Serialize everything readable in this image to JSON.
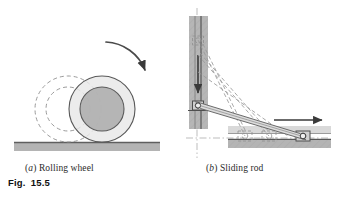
{
  "figure": {
    "label_prefix": "Fig.",
    "label_number": "15.5",
    "panels": [
      {
        "id": "a",
        "tag": "(a)",
        "tag_letter": "a",
        "caption": "Rolling wheel",
        "description": "Rolling wheel shown in two positions: dashed earlier position at left and solid current position at right, resting on a horizontal ground surface, with a curved arrow indicating clockwise rotation.",
        "elements": [
          "ground-bar",
          "wheel-ghost-outline",
          "wheel-solid",
          "wheel-hub",
          "rotation-arrow"
        ]
      },
      {
        "id": "b",
        "tag": "(b)",
        "tag_letter": "b",
        "caption": "Sliding rod",
        "description": "Rod with one end sliding down a vertical guide and the other end sliding right along a horizontal guide; dashed lines show earlier and later rod positions. Arrows show the direction of motion of each slider.",
        "elements": [
          "vertical-guide",
          "vertical-slider",
          "down-arrow",
          "rod-solid",
          "rod-ghost-1",
          "rod-ghost-2",
          "rod-ghost-3",
          "horizontal-guide",
          "horizontal-slider",
          "right-arrow",
          "centerline-vertical",
          "centerline-horizontal"
        ]
      }
    ]
  },
  "colors": {
    "ink": "#2b2b2b",
    "label_ink": "#111111",
    "ground_fill": "#b4b4b4",
    "ground_edge": "#6e6e6e",
    "wheel_rim_fill": "#e6e6e6",
    "wheel_hub_fill": "#b0b0b0",
    "wheel_stroke": "#555555",
    "ghost_stroke": "#8c8c8c",
    "guide_fill": "#b6b6b6",
    "guide_edge": "#6e6e6e",
    "rod_fill": "#d8d8d8",
    "rod_stroke": "#6b6b6b",
    "slider_fill": "#cfcfcf",
    "arrow_ink": "#3a3a3a",
    "centerline": "#9a9a9a",
    "page_background": "#ffffff"
  }
}
